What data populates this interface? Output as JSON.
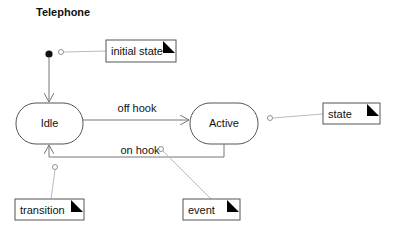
{
  "diagram": {
    "title": "Telephone",
    "states": [
      {
        "id": "idle",
        "label": "Idle"
      },
      {
        "id": "active",
        "label": "Active"
      }
    ],
    "transitions": [
      {
        "from": "idle",
        "to": "active",
        "label": "off hook"
      },
      {
        "from": "active",
        "to": "idle",
        "label": "on hook"
      }
    ],
    "notes": {
      "initial_state": "initial state",
      "state": "state",
      "transition": "transition",
      "event": "event"
    },
    "colors": {
      "line": "#777777",
      "note_border": "#555555",
      "connector": "#bbbbbb",
      "fill": "#ffffff",
      "ink": "#111111"
    }
  }
}
